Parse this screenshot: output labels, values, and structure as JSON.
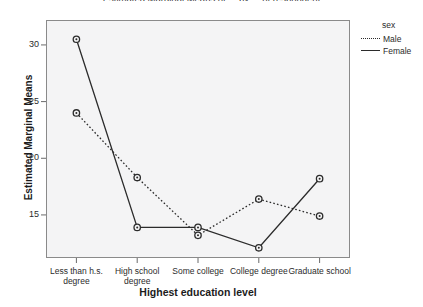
{
  "chart_data": {
    "type": "line",
    "title": "Estimated Marginal Means of ... by ... of respondent",
    "xlabel": "Highest education level",
    "ylabel": "Estimated Marginal Means",
    "categories": [
      "Less than h.s. degree",
      "High school degree",
      "Some college",
      "College degree",
      "Graduate school"
    ],
    "yticks": [
      15,
      20,
      25,
      30
    ],
    "ylim": [
      11.2,
      32.2
    ],
    "grid": false,
    "legend_position": "right",
    "legend_title": "sex",
    "series": [
      {
        "name": "Male",
        "style": "dotted",
        "values": [
          24.0,
          18.3,
          13.2,
          16.4,
          14.9
        ]
      },
      {
        "name": "Female",
        "style": "solid",
        "values": [
          30.5,
          13.9,
          13.9,
          12.1,
          18.2
        ]
      }
    ]
  },
  "legend": {
    "title": "sex",
    "items": [
      {
        "label": "Male"
      },
      {
        "label": "Female"
      }
    ]
  },
  "colors": {
    "line": "#2b2b2b",
    "frame": "#8a8a8a",
    "plot_background": "#f4f4f5",
    "page_background": "#ffffff"
  }
}
